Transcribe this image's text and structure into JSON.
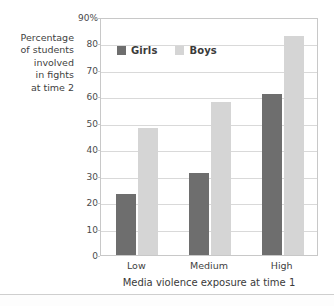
{
  "chart_data": {
    "type": "bar",
    "title": "",
    "subtitle": "",
    "xlabel": "Media violence exposure at time 1",
    "ylabel": "Percentage of students involved in fights at time 2",
    "ylabel_lines": [
      "Percentage",
      "of students",
      "involved",
      "in fights",
      "at time 2"
    ],
    "categories": [
      "Low",
      "Medium",
      "High"
    ],
    "series": [
      {
        "name": "Girls",
        "values": [
          23,
          31,
          61
        ],
        "color": "#6e6e6e"
      },
      {
        "name": "Boys",
        "values": [
          48,
          58,
          83
        ],
        "color": "#d5d5d5"
      }
    ],
    "ylim": [
      0,
      90
    ],
    "ytick_values": [
      0,
      10,
      20,
      30,
      40,
      50,
      60,
      70,
      80,
      90
    ],
    "ytick_labels": [
      "0",
      "10",
      "20",
      "30",
      "40",
      "50",
      "60",
      "70",
      "80",
      "90%"
    ],
    "grid": true,
    "grid_axis": "y",
    "legend_position": "top-left-inside",
    "legend_entries": [
      "Girls",
      "Boys"
    ],
    "axis_color": "#c8c8c8",
    "gridline_color": "#d9d9d9",
    "background_color": "#ffffff"
  }
}
